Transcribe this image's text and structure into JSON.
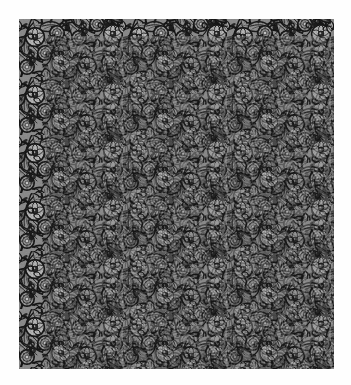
{
  "page": {
    "width": 351,
    "height": 385,
    "background_color": "#fefefe",
    "margin_color": "#fefefe"
  },
  "swatch": {
    "name": "floral-damask-textile-swatch",
    "x": 19,
    "y": 19,
    "width": 315,
    "height": 350,
    "description": "Dense all-over floral and foliate textile pattern, grayscale",
    "motifs": [
      "scrolling-stem",
      "serrated-leaf",
      "open-blossom",
      "rosette",
      "bud",
      "tendril",
      "berry-cluster"
    ],
    "repeat": {
      "type": "half-drop",
      "tile_width": 52,
      "tile_height": 58,
      "columns": 6,
      "rows": 6
    },
    "colors": {
      "ink_darkest": "#141414",
      "ink_dark": "#262626",
      "ink_mid": "#3d3d3d",
      "ground_shadow": "#5e5e5e",
      "ground_mid": "#8a8a8a",
      "ground_light": "#a6a6a6",
      "highlight": "#c2c2c2",
      "highlight_bright": "#d8d8d8"
    },
    "texture": {
      "style": "stipple",
      "grain_opacity": 0.35,
      "line_weight_min": 0.5,
      "line_weight_max": 2.2
    }
  },
  "labels": {
    "caption": "",
    "plate_number": "",
    "credit": ""
  }
}
